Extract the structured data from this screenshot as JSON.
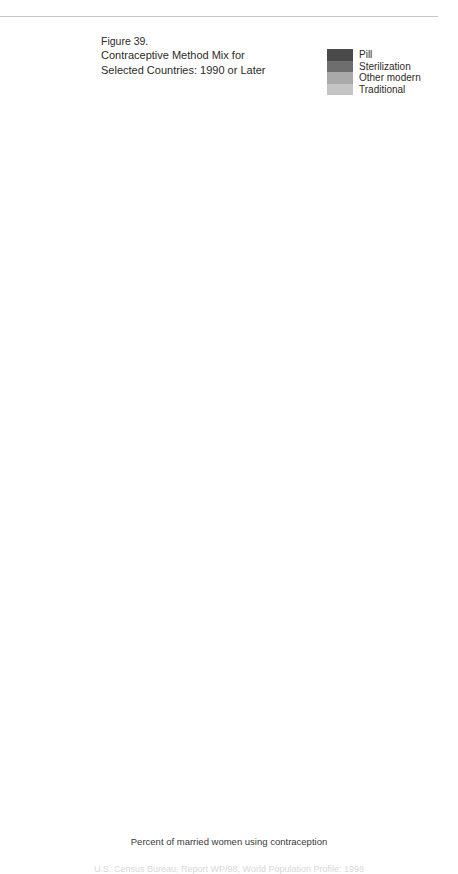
{
  "figure": {
    "number": "Figure 39.",
    "title_line1": "Contraceptive Method Mix for",
    "title_line2": "Selected Countries:  1990 or Later",
    "axis_caption": "Percent of married women using contraception",
    "footer_partial": "U.S. Census Bureau, Report WP/98, World Population Profile: 1998"
  },
  "legend": {
    "items": [
      {
        "label": "Pill",
        "color": "#4a4a4a"
      },
      {
        "label": "Sterilization",
        "color": "#6e6e6e"
      },
      {
        "label": "Other modern",
        "color": "#a9a9a9"
      },
      {
        "label": "Traditional",
        "color": "#c4c4c4"
      }
    ]
  },
  "axis": {
    "ticks": [
      0,
      20,
      40,
      60,
      80,
      100
    ],
    "tick_labels": [
      "0",
      "20",
      "40",
      "60",
      "80",
      "100"
    ],
    "min": 0,
    "max": 100
  },
  "chart_data": {
    "type": "bar",
    "orientation": "horizontal",
    "stacked": true,
    "normalized_percent": true,
    "title": "Contraceptive Method Mix for Selected Countries:  1990 or Later",
    "xlabel": "Percent of married women using contraception",
    "ylabel": "",
    "xlim": [
      0,
      100
    ],
    "grid": true,
    "legend_position": "top-right",
    "series_names": [
      "Pill",
      "Sterilization",
      "Other modern",
      "Traditional"
    ],
    "series_colors": [
      "#4a4a4a",
      "#6e6e6e",
      "#a9a9a9",
      "#c4c4c4"
    ],
    "panels": [
      {
        "title": "Under 20 percent prevalence",
        "categories": [
          "Burkina Faso 1993",
          "Pakistan 1990–91",
          "Malawi 1992",
          "Cameroon 1991",
          "Haiti 1994"
        ],
        "series": [
          {
            "name": "Pill",
            "values": [
              27,
              6,
              17,
              8,
              17
            ]
          },
          {
            "name": "Sterilization",
            "values": [
              3,
              29,
              13,
              7,
              18
            ]
          },
          {
            "name": "Other modern",
            "values": [
              22,
              40,
              27,
              12,
              40
            ]
          },
          {
            "name": "Traditional",
            "values": [
              48,
              25,
              43,
              73,
              25
            ]
          }
        ]
      },
      {
        "title": "20-39 percent prevalence",
        "categories": [
          "Ghana 1993",
          "Nepal 1991",
          "Kenya 1993",
          "Jordan 1990"
        ],
        "series": [
          {
            "name": "Pill",
            "values": [
              16,
              4.5,
              29,
              13.5
            ]
          },
          {
            "name": "Sterilization",
            "values": [
              4,
              78.5,
              17,
              15.5
            ]
          },
          {
            "name": "Other modern",
            "values": [
              30,
              13,
              37,
              48
            ]
          },
          {
            "name": "Traditional",
            "values": [
              50,
              4,
              17,
              23
            ]
          }
        ]
      },
      {
        "title": "40-49 percent prevalence",
        "categories": [
          "Philippines 1993",
          "India 1992–93",
          "Morocco 1992",
          "Zimbabwe 1994",
          "Egypt 1992"
        ],
        "series": [
          {
            "name": "Pill",
            "values": [
              21,
              3,
              68,
              68,
              27.5
            ]
          },
          {
            "name": "Sterilization",
            "values": [
              31,
              76,
              7,
              6,
              2.5
            ]
          },
          {
            "name": "Other modern",
            "values": [
              10,
              10,
              11,
              13,
              65
            ]
          },
          {
            "name": "Traditional",
            "values": [
              38,
              11,
              14,
              13,
              5
            ]
          }
        ]
      },
      {
        "title": "50 percent or higher prevalence",
        "categories": [
          "Belarus 1995",
          "Colombia 1990",
          "United States 1990",
          "Czech Republic 1993",
          "France 1994"
        ],
        "series": [
          {
            "name": "Pill",
            "values": [
              13,
              21,
              20.5,
              12,
              49
            ]
          },
          {
            "name": "Sterilization",
            "values": [
              2,
              32.5,
              52.5,
              3.5,
              6.5
            ]
          },
          {
            "name": "Other modern",
            "values": [
              68,
              29,
              23,
              49.5,
              34.5
            ]
          },
          {
            "name": "Traditional",
            "values": [
              17,
              17.5,
              4,
              35,
              10
            ]
          }
        ]
      }
    ]
  }
}
